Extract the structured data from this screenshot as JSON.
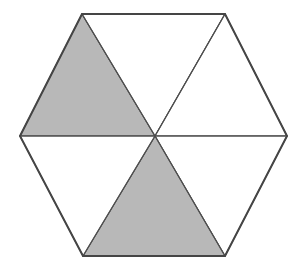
{
  "figure": {
    "name": "hexagon-sixths-shaded",
    "type": "geometric-fraction-diagram",
    "shape": "regular-hexagon",
    "total_parts": 6,
    "shaded_parts": 2,
    "unshaded_parts": 4,
    "fraction_shaded": "2/6",
    "canvas": {
      "width": 302,
      "height": 272
    },
    "colors": {
      "background": "#ffffff",
      "shaded_fill": "#b8b8b8",
      "unshaded_fill": "#ffffff",
      "outline_stroke": "#454545",
      "spoke_stroke": "#4f4f4f"
    },
    "stroke_widths": {
      "outline": 2,
      "spoke": 1.1,
      "sector_edge": 1.1
    },
    "center": {
      "x": 155,
      "y": 136
    },
    "vertices": [
      {
        "name": "left",
        "x": 20,
        "y": 136
      },
      {
        "name": "top-left",
        "x": 82,
        "y": 14
      },
      {
        "name": "top-right",
        "x": 225,
        "y": 14
      },
      {
        "name": "right",
        "x": 287,
        "y": 136
      },
      {
        "name": "bottom-right",
        "x": 225,
        "y": 256
      },
      {
        "name": "bottom-left",
        "x": 83,
        "y": 256
      }
    ],
    "outline_points": "20,136 82,14 225,14 287,136 225,256 83,256",
    "sectors": [
      {
        "name": "upper-left",
        "points": "20,136 82,14 155,136",
        "shaded": true,
        "fill": "#b8b8b8"
      },
      {
        "name": "upper-middle",
        "points": "82,14 225,14 155,136",
        "shaded": false,
        "fill": "#ffffff"
      },
      {
        "name": "upper-right",
        "points": "225,14 287,136 155,136",
        "shaded": false,
        "fill": "#ffffff"
      },
      {
        "name": "lower-right",
        "points": "287,136 225,256 155,136",
        "shaded": false,
        "fill": "#ffffff"
      },
      {
        "name": "lower-middle",
        "points": "225,256 83,256 155,136",
        "shaded": true,
        "fill": "#b8b8b8"
      },
      {
        "name": "lower-left",
        "points": "83,256 20,136 155,136",
        "shaded": false,
        "fill": "#ffffff"
      }
    ],
    "spokes": [
      {
        "name": "spoke-to-left",
        "x1": 155,
        "y1": 136,
        "x2": 20,
        "y2": 136
      },
      {
        "name": "spoke-to-top-left",
        "x1": 155,
        "y1": 136,
        "x2": 82,
        "y2": 14
      },
      {
        "name": "spoke-to-top-right",
        "x1": 155,
        "y1": 136,
        "x2": 225,
        "y2": 14
      },
      {
        "name": "spoke-to-right",
        "x1": 155,
        "y1": 136,
        "x2": 287,
        "y2": 136
      },
      {
        "name": "spoke-to-bottom-right",
        "x1": 155,
        "y1": 136,
        "x2": 225,
        "y2": 256
      },
      {
        "name": "spoke-to-bottom-left",
        "x1": 155,
        "y1": 136,
        "x2": 83,
        "y2": 256
      }
    ]
  }
}
